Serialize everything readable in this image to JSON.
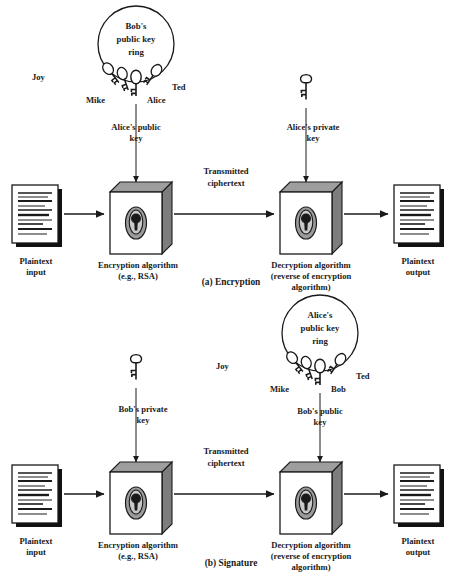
{
  "figure": {
    "panels": [
      {
        "id": "a",
        "caption": "(a) Encryption",
        "keyring": {
          "label_line1": "Bob's",
          "label_line2": "public key",
          "label_line3": "ring",
          "keys": [
            "Joy",
            "Mike",
            "Alice",
            "Ted"
          ],
          "selected_key": "Alice"
        },
        "left_key_label_line1": "Alice's public",
        "left_key_label_line2": "key",
        "right_key_label_line1": "Alice's private",
        "right_key_label_line2": "key",
        "right_key_icon": "private-key-icon",
        "input_label_line1": "Plaintext",
        "input_label_line2": "input",
        "enc_label_line1": "Encryption algorithm",
        "enc_label_line2": "(e.g., RSA)",
        "channel_label_line1": "Transmitted",
        "channel_label_line2": "ciphertext",
        "dec_label_line1": "Decryption algorithm",
        "dec_label_line2": "(reverse of encryption",
        "dec_label_line3": "algorithm)",
        "output_label_line1": "Plaintext",
        "output_label_line2": "output"
      },
      {
        "id": "b",
        "caption": "(b) Signature",
        "keyring": {
          "label_line1": "Alice's",
          "label_line2": "public key",
          "label_line3": "ring",
          "keys": [
            "Joy",
            "Mike",
            "Bob",
            "Ted"
          ],
          "selected_key": "Bob"
        },
        "left_key_label_line1": "Bob's private",
        "left_key_label_line2": "key",
        "left_key_icon": "private-key-icon",
        "right_key_label_line1": "Bob's public",
        "right_key_label_line2": "key",
        "input_label_line1": "Plaintext",
        "input_label_line2": "input",
        "enc_label_line1": "Encryption algorithm",
        "enc_label_line2": "(e.g., RSA)",
        "channel_label_line1": "Transmitted",
        "channel_label_line2": "ciphertext",
        "dec_label_line1": "Decryption algorithm",
        "dec_label_line2": "(reverse of encryption",
        "dec_label_line3": "algorithm)",
        "output_label_line1": "Plaintext",
        "output_label_line2": "output"
      }
    ],
    "colors": {
      "ink": "#1a1a1a",
      "box_top": "#9e9e9e",
      "box_side": "#7d7d7d",
      "lock_outer": "#9a9a9a",
      "lock_inner": "#c9c9c9",
      "background": "#ffffff"
    }
  }
}
